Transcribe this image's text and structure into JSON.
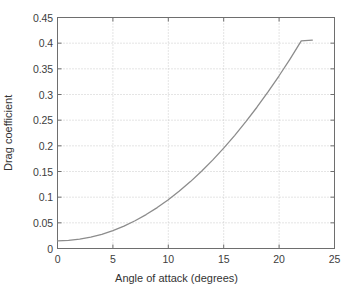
{
  "chart_data": {
    "type": "line",
    "title": "",
    "subtitle": "",
    "xlabel": "Angle of attack (degrees)",
    "ylabel": "Drag coefficient",
    "xlim": [
      0,
      25
    ],
    "ylim": [
      0,
      0.45
    ],
    "xticks": [
      "0",
      "5",
      "10",
      "15",
      "20",
      "25"
    ],
    "xtick_values": [
      0,
      5,
      10,
      15,
      20,
      25
    ],
    "yticks": [
      "0",
      "0.05",
      "0.1",
      "0.15",
      "0.2",
      "0.25",
      "0.3",
      "0.35",
      "0.4",
      "0.45"
    ],
    "ytick_values": [
      0,
      0.05,
      0.1,
      0.15,
      0.2,
      0.25,
      0.3,
      0.35,
      0.4,
      0.45
    ],
    "grid": true,
    "grid_style": "dotted",
    "legend": false,
    "legend_position": "none",
    "series": [
      {
        "name": "Drag coefficient",
        "color": "#8c8c8c",
        "line_width": 1.3,
        "x": [
          0,
          1,
          2,
          3,
          4,
          5,
          6,
          7,
          8,
          9,
          10,
          11,
          12,
          13,
          14,
          15,
          16,
          17,
          18,
          19,
          20,
          21,
          22,
          23
        ],
        "values": [
          0.015,
          0.0158,
          0.0181,
          0.0221,
          0.0277,
          0.0349,
          0.0437,
          0.0541,
          0.0661,
          0.0797,
          0.095,
          0.1118,
          0.1303,
          0.1504,
          0.1721,
          0.1955,
          0.2204,
          0.247,
          0.2752,
          0.3051,
          0.3365,
          0.3696,
          0.4043,
          0.406
        ]
      }
    ],
    "annotations": [],
    "colors": {
      "curve": "#8c8c8c",
      "axis": "#6e6e6e",
      "grid": "#bdbdbd",
      "text": "#3b3b3b",
      "background": "#ffffff"
    }
  }
}
